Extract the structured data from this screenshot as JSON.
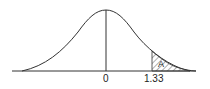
{
  "diagram": {
    "labels": {
      "mean": "0",
      "z_value": "1.33",
      "area": "A"
    },
    "colors": {
      "stroke": "#333333",
      "background": "#ffffff"
    }
  }
}
